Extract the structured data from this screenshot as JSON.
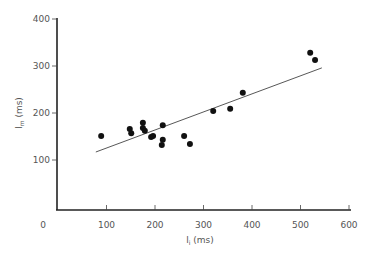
{
  "chart_data": {
    "type": "scatter",
    "title": "",
    "xlabel": "l_i (ms)",
    "ylabel": "l_m (ms)",
    "xlim": [
      0,
      600
    ],
    "ylim": [
      0,
      400
    ],
    "x_ticks": [
      "0",
      "100",
      "200",
      "300",
      "400",
      "500",
      "600"
    ],
    "y_ticks": [
      "100",
      "200",
      "300",
      "400"
    ],
    "grid": false,
    "points": [
      [
        89,
        151
      ],
      [
        148,
        166
      ],
      [
        151,
        157
      ],
      [
        175,
        179
      ],
      [
        175,
        168
      ],
      [
        179,
        162
      ],
      [
        192,
        149
      ],
      [
        196,
        151
      ],
      [
        216,
        174
      ],
      [
        216,
        143
      ],
      [
        214,
        132
      ],
      [
        260,
        151
      ],
      [
        272,
        134
      ],
      [
        320,
        204
      ],
      [
        355,
        209
      ],
      [
        381,
        243
      ],
      [
        520,
        328
      ],
      [
        530,
        313
      ]
    ],
    "regression_line": {
      "x1": 78,
      "y1": 117,
      "x2": 544,
      "y2": 296
    }
  }
}
